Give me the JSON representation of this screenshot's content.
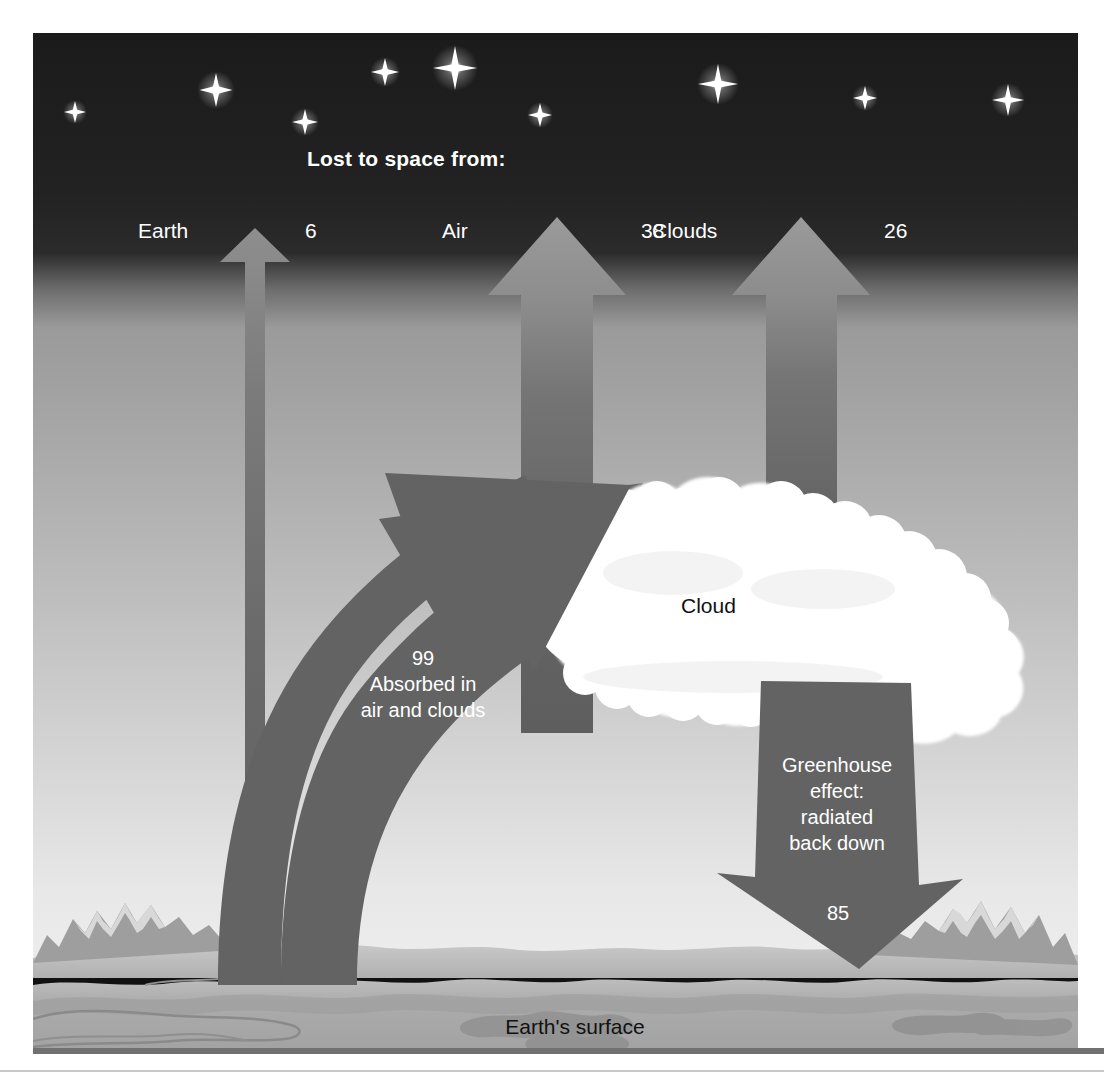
{
  "diagram": {
    "heading": "Lost to space from:",
    "surface_label": "Earth's surface",
    "cloud_label": "Cloud",
    "outgoing": [
      {
        "name": "earth",
        "label": "Earth",
        "value": "6"
      },
      {
        "name": "air",
        "label": "Air",
        "value": "38"
      },
      {
        "name": "clouds",
        "label": "Clouds",
        "value": "26"
      }
    ],
    "absorbed": {
      "value": "99",
      "line1": "Absorbed in",
      "line2": "air and clouds"
    },
    "greenhouse": {
      "line1": "Greenhouse",
      "line2": "effect:",
      "line3": "radiated",
      "line4": "back down",
      "value": "85"
    },
    "colors": {
      "arrow_gray": "#636363",
      "arrow_gray_light": "#8f8f8f",
      "sky_top": "#202020",
      "sky_mid": "#9c9c9c",
      "sky_low": "#e9e9e9",
      "ground": "#a7a7a7",
      "ground_light": "#c5c5c5",
      "cloud_white": "#ffffff",
      "text_light": "#ffffff",
      "text_dark": "#111111",
      "rule_gray": "#707070",
      "page_bg": "#ffffff"
    },
    "stars": [
      {
        "cx": 42,
        "cy": 79,
        "r": 11
      },
      {
        "cx": 183,
        "cy": 57,
        "r": 17
      },
      {
        "cx": 272,
        "cy": 89,
        "r": 13
      },
      {
        "cx": 352,
        "cy": 39,
        "r": 14
      },
      {
        "cx": 422,
        "cy": 35,
        "r": 20
      },
      {
        "cx": 507,
        "cy": 82,
        "r": 12
      },
      {
        "cx": 685,
        "cy": 51,
        "r": 19
      },
      {
        "cx": 832,
        "cy": 65,
        "r": 12
      },
      {
        "cx": 975,
        "cy": 67,
        "r": 15
      }
    ]
  }
}
